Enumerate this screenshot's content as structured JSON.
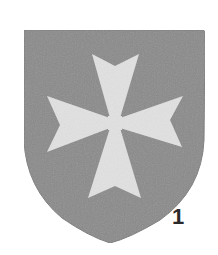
{
  "figure": {
    "number": "1"
  },
  "colors": {
    "background": "#ffffff",
    "shield": "#8a8a8a",
    "shield_edge": "#7a7a7a",
    "cross": "#e2e2e2",
    "number": "#2a2a2a"
  }
}
